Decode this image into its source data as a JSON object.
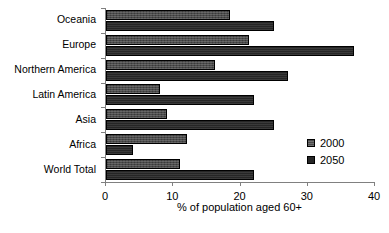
{
  "chart_data": {
    "type": "bar",
    "orientation": "horizontal",
    "title": "",
    "subtitle": "",
    "xlabel": "% of population aged 60+",
    "ylabel": "",
    "xlim": [
      0,
      40
    ],
    "xticks": [
      0,
      10,
      20,
      30,
      40
    ],
    "xtick_labels": [
      "0",
      "10",
      "20",
      "30",
      "40"
    ],
    "grid": false,
    "legend_position": "right",
    "categories": [
      "Oceania",
      "Europe",
      "Northern America",
      "Latin America",
      "Asia",
      "Africa",
      "World Total"
    ],
    "series": [
      {
        "name": "2000",
        "color": "#4a4a4a",
        "values": [
          18.4,
          21.3,
          16.2,
          8.0,
          9.0,
          12.0,
          11.0
        ]
      },
      {
        "name": "2050",
        "color": "#262626",
        "values": [
          25.0,
          36.9,
          27.0,
          22.0,
          25.0,
          4.0,
          22.0
        ]
      }
    ]
  },
  "legend": {
    "entries": [
      {
        "label": "2000"
      },
      {
        "label": "2050"
      }
    ]
  },
  "axis": {
    "x_title": "% of population aged 60+"
  }
}
